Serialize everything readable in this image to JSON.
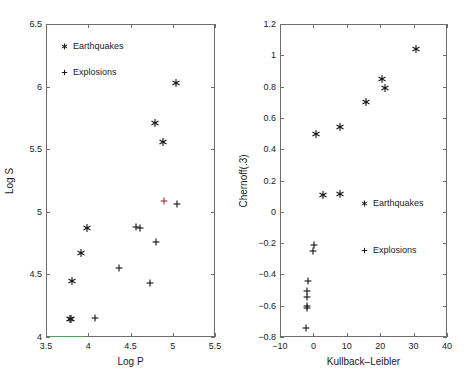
{
  "figure": {
    "background_color": "#ffffff",
    "axis_color": "#6e6e6e",
    "marker_color": "#1a1a1a",
    "highlight_marker_color": "#a03535",
    "overlay_line_color": "#3faa57"
  },
  "panels": [
    {
      "id": "left",
      "legend": [
        {
          "glyph": "star-marker",
          "label": "Earthquakes"
        },
        {
          "glyph": "plus-marker",
          "label": "Explosions"
        }
      ],
      "chart_data": {
        "type": "scatter",
        "title": "",
        "xlabel": "Log P",
        "ylabel": "Log S",
        "xlim": [
          3.5,
          5.5
        ],
        "ylim": [
          4.0,
          6.5
        ],
        "xticks": [
          3.5,
          4,
          4.5,
          5,
          5.5
        ],
        "xticklabels": [
          "3.5",
          "4",
          "4.5",
          "5",
          "5.5"
        ],
        "yticks": [
          4,
          4.5,
          5,
          5.5,
          6,
          6.5
        ],
        "yticklabels": [
          "4",
          "4.5",
          "5",
          "5.5",
          "6",
          "6.5"
        ],
        "grid": false,
        "legend_position": "upper left",
        "series": [
          {
            "name": "Earthquakes",
            "marker": "star-marker",
            "color": "#1a1a1a",
            "points": [
              {
                "x": 3.78,
                "y": 4.145
              },
              {
                "x": 3.8,
                "y": 4.145
              },
              {
                "x": 3.81,
                "y": 4.45
              },
              {
                "x": 3.91,
                "y": 4.67
              },
              {
                "x": 3.98,
                "y": 4.87
              },
              {
                "x": 4.79,
                "y": 5.71
              },
              {
                "x": 4.88,
                "y": 5.56
              },
              {
                "x": 5.04,
                "y": 6.03
              }
            ]
          },
          {
            "name": "Explosions",
            "marker": "plus-marker",
            "color": "#1a1a1a",
            "points": [
              {
                "x": 4.08,
                "y": 4.15
              },
              {
                "x": 4.36,
                "y": 4.55
              },
              {
                "x": 4.56,
                "y": 4.88
              },
              {
                "x": 4.61,
                "y": 4.87
              },
              {
                "x": 4.73,
                "y": 4.43
              },
              {
                "x": 4.8,
                "y": 4.76
              },
              {
                "x": 5.05,
                "y": 5.06
              }
            ]
          },
          {
            "name": "Explosions (highlighted)",
            "marker": "plus-marker",
            "color": "#a03535",
            "points": [
              {
                "x": 4.9,
                "y": 5.09
              }
            ]
          }
        ],
        "overlay_line": {
          "name": "baseline-segment",
          "color": "#3faa57",
          "x_start": 3.54,
          "x_end": 3.95,
          "y": 4.0
        }
      }
    },
    {
      "id": "right",
      "legend": [
        {
          "glyph": "star-marker",
          "label": "Earthquakes"
        },
        {
          "glyph": "plus-marker",
          "label": "Explosions"
        }
      ],
      "chart_data": {
        "type": "scatter",
        "title": "",
        "xlabel": "Kullback–Leibler",
        "ylabel": "Chernoff(.3)",
        "xlim": [
          -10,
          40
        ],
        "ylim": [
          -0.8,
          1.2
        ],
        "xticks": [
          -10,
          0,
          10,
          20,
          30,
          40
        ],
        "xticklabels": [
          "−10",
          "0",
          "10",
          "20",
          "30",
          "40"
        ],
        "yticks": [
          -0.8,
          -0.6,
          -0.4,
          -0.2,
          0,
          0.2,
          0.4,
          0.6,
          0.8,
          1.0,
          1.2
        ],
        "yticklabels": [
          "−0.8",
          "−0.6",
          "−0.4",
          "−0.2",
          "0",
          "0.2",
          "0.4",
          "0.6",
          "0.8",
          "1",
          "1.2"
        ],
        "grid": false,
        "legend_position": "middle",
        "series": [
          {
            "name": "Earthquakes",
            "marker": "star-marker",
            "color": "#1a1a1a",
            "points": [
              {
                "x": 0.8,
                "y": 0.5
              },
              {
                "x": 2.8,
                "y": 0.105
              },
              {
                "x": 7.9,
                "y": 0.115
              },
              {
                "x": 8.1,
                "y": 0.54
              },
              {
                "x": 15.6,
                "y": 0.7
              },
              {
                "x": 20.5,
                "y": 0.85
              },
              {
                "x": 21.4,
                "y": 0.79
              },
              {
                "x": 30.8,
                "y": 1.04
              }
            ]
          },
          {
            "name": "Explosions",
            "marker": "plus-marker",
            "color": "#1a1a1a",
            "points": [
              {
                "x": 0.2,
                "y": -0.21
              },
              {
                "x": -0.1,
                "y": -0.25
              },
              {
                "x": -1.5,
                "y": -0.445
              },
              {
                "x": -2.0,
                "y": -0.505
              },
              {
                "x": -2.0,
                "y": -0.545
              },
              {
                "x": -2.0,
                "y": -0.6
              },
              {
                "x": -1.9,
                "y": -0.615
              },
              {
                "x": -2.2,
                "y": -0.745
              }
            ]
          }
        ]
      }
    }
  ]
}
